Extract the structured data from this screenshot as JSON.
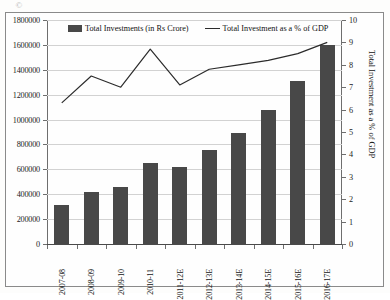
{
  "figure": {
    "smudge_glyph": "©"
  },
  "legend": {
    "position": "top-center",
    "items": [
      {
        "label": "Total Investments (in Rs Crore)",
        "marker": "bar-swatch-icon",
        "color": "#484848"
      },
      {
        "label": "Total Investment as a % of GDP",
        "marker": "line-swatch-icon",
        "color": "#2b2b2b"
      }
    ]
  },
  "chart_data": {
    "type": "bar",
    "title": "",
    "subtitle": "",
    "xlabel": "",
    "ylabel": "",
    "ylabel_secondary": "Total Investment as a % of GDP",
    "grid": true,
    "legend_position": "top-center",
    "categories": [
      "2007-08",
      "2008-09",
      "2009-10",
      "2010-11",
      "2011-12E",
      "2012-13E",
      "2013-14E",
      "2014-15E",
      "2015-16E",
      "2016-17E"
    ],
    "ylim": [
      0,
      1800000
    ],
    "yticks": [
      0,
      200000,
      400000,
      600000,
      800000,
      1000000,
      1200000,
      1400000,
      1600000,
      1800000
    ],
    "ytick_labels": [
      "0",
      "200000",
      "400000",
      "600000",
      "800000",
      "1000000",
      "1200000",
      "1400000",
      "1600000",
      "1800000"
    ],
    "ylim_secondary": [
      0,
      10
    ],
    "yticks_secondary": [
      0,
      1,
      2,
      3,
      4,
      5,
      6,
      7,
      8,
      9,
      10
    ],
    "ytick_labels_secondary": [
      "0",
      "1",
      "2",
      "3",
      "4",
      "5",
      "6",
      "7",
      "8",
      "9",
      "10"
    ],
    "series": [
      {
        "name": "Total Investments (in Rs Crore)",
        "type": "bar",
        "axis": "left",
        "color": "#484848",
        "values": [
          310000,
          415000,
          455000,
          650000,
          615000,
          755000,
          895000,
          1075000,
          1310000,
          1600000
        ]
      },
      {
        "name": "Total Investment as a % of GDP",
        "type": "line",
        "axis": "right",
        "color": "#2b2b2b",
        "values": [
          6.3,
          7.5,
          7.0,
          8.7,
          7.1,
          7.8,
          8.0,
          8.2,
          8.5,
          9.0
        ]
      }
    ]
  }
}
